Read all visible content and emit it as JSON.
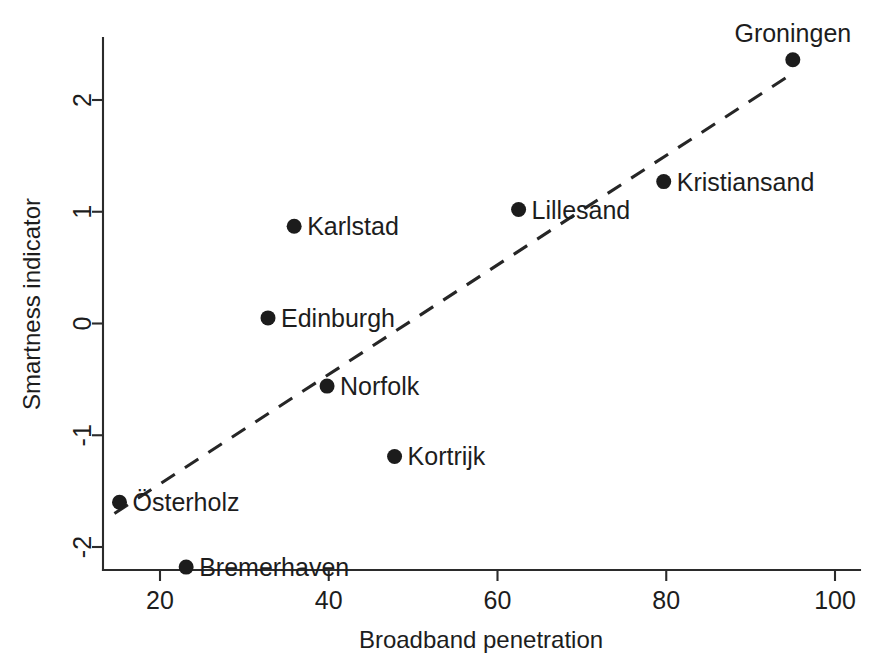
{
  "chart_data": {
    "type": "scatter",
    "title": "",
    "xlabel": "Broadband penetration",
    "ylabel": "Smartness indicator",
    "xlim": [
      13,
      101
    ],
    "ylim": [
      -2.42,
      2.6
    ],
    "grid": false,
    "legend": "none",
    "xticks": [
      20,
      40,
      60,
      80,
      100
    ],
    "xtick_labels": [
      "20",
      "40",
      "60",
      "80",
      "100"
    ],
    "yticks": [
      2,
      1,
      0,
      -1,
      -2
    ],
    "ytick_labels": [
      "2",
      "1",
      "0",
      "-1",
      "-2"
    ],
    "points": [
      {
        "label": "Groningen",
        "x": 95.0,
        "y": 2.36,
        "label_pos": "above"
      },
      {
        "label": "Kristiansand",
        "x": 79.7,
        "y": 1.27,
        "label_pos": "right"
      },
      {
        "label": "Lillesand",
        "x": 62.5,
        "y": 1.02,
        "label_pos": "right"
      },
      {
        "label": "Karlstad",
        "x": 35.9,
        "y": 0.87,
        "label_pos": "right"
      },
      {
        "label": "Edinburgh",
        "x": 32.8,
        "y": 0.05,
        "label_pos": "right"
      },
      {
        "label": "Norfolk",
        "x": 39.8,
        "y": -0.56,
        "label_pos": "right"
      },
      {
        "label": "Kortrijk",
        "x": 47.8,
        "y": -1.19,
        "label_pos": "right"
      },
      {
        "label": "Osterholz",
        "x": 15.2,
        "y": -1.6,
        "label_pos": "right"
      },
      {
        "label": "Bremerhaven",
        "x": 23.1,
        "y": -2.18,
        "label_pos": "right"
      }
    ],
    "trend_line": {
      "style": "dashed",
      "x_start": 14.6,
      "y_start": -1.7,
      "x_end": 94.2,
      "y_end": 2.2
    },
    "annotations": {
      "osterholz_display": "Österholz"
    },
    "colors": {
      "marker": "#1c1c1c",
      "axis": "#2b2b2b",
      "trend": "#262626",
      "background": "#ffffff",
      "text": "#1d1d1d"
    }
  }
}
